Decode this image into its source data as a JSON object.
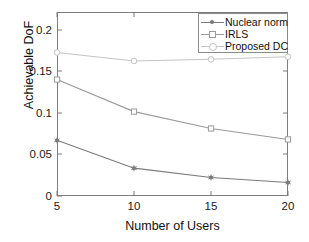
{
  "chart_data": {
    "type": "line",
    "title": "",
    "xlabel": "Number of Users",
    "ylabel": "Achievable DoF",
    "x": [
      5,
      10,
      15,
      20
    ],
    "xlim": [
      5,
      20
    ],
    "ylim": [
      0,
      0.218
    ],
    "xticks": [
      "5",
      "10",
      "15",
      "20"
    ],
    "yticks": [
      "0",
      "0.05",
      "0.1",
      "0.15",
      "0.2"
    ],
    "ytick_values": [
      0,
      0.05,
      0.1,
      0.15,
      0.2
    ],
    "grid": false,
    "legend_position": "top right",
    "series": [
      {
        "name": "Nuclear norm",
        "marker": "filled-star",
        "color": "#7a7a7a",
        "values": [
          0.066,
          0.033,
          0.022,
          0.016
        ]
      },
      {
        "name": "IRLS",
        "marker": "square",
        "color": "#9a9a9a",
        "values": [
          0.138,
          0.1,
          0.08,
          0.067
        ]
      },
      {
        "name": "Proposed DC",
        "marker": "circle",
        "color": "#c4c4c4",
        "values": [
          0.17,
          0.16,
          0.162,
          0.165
        ]
      }
    ]
  },
  "axis": {
    "frame_color": "#7d7d7d",
    "tick_color": "#7d7d7d"
  },
  "legend": {
    "entries": [
      {
        "label": "Nuclear norm"
      },
      {
        "label": "IRLS"
      },
      {
        "label": "Proposed DC"
      }
    ]
  }
}
